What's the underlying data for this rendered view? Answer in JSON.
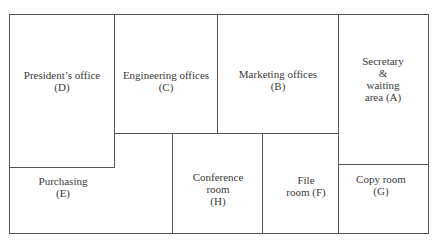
{
  "diagram": {
    "type": "floor-plan",
    "rooms": [
      {
        "id": "D",
        "name": "President’s office",
        "line1": "President’s office",
        "line2": "(D)"
      },
      {
        "id": "C",
        "name": "Engineering offices",
        "line1": "Engineering offices",
        "line2": "(C)"
      },
      {
        "id": "B",
        "name": "Marketing offices",
        "line1": "Marketing offices",
        "line2": "(B)"
      },
      {
        "id": "A",
        "name": "Secretary & waiting area",
        "line1": "Secretary",
        "line2": "&",
        "line3": "waiting",
        "line4": "area (A)"
      },
      {
        "id": "E",
        "name": "Purchasing",
        "line1": "Purchasing",
        "line2": "(E)"
      },
      {
        "id": "H",
        "name": "Conference room",
        "line1": "Conference",
        "line2": "room",
        "line3": "(H)"
      },
      {
        "id": "F",
        "name": "File room",
        "line1": "File",
        "line2": "room (F)"
      },
      {
        "id": "G",
        "name": "Copy room",
        "line1": "Copy room",
        "line2": "(G)"
      }
    ],
    "line_color": "#555555"
  }
}
